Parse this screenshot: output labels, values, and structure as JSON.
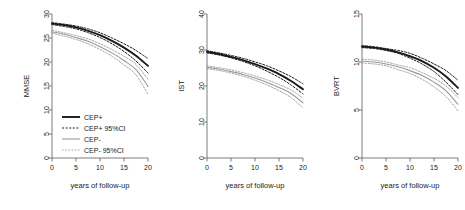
{
  "figure": {
    "title": "",
    "panel_count": 3,
    "background": "#ffffff",
    "colors": {
      "cep_plus": "#1a1a1a",
      "cep_minus": "#9a9a9a",
      "axis": "#5a5a5a",
      "text": "#1a1a1a"
    }
  },
  "legend": {
    "position": "bottom-left of panel 1",
    "items": [
      {
        "label": "CEP+",
        "style": "solid",
        "color": "#1a1a1a",
        "width": 1.9
      },
      {
        "label": "CEP+ 95%CI",
        "style": "dashed",
        "color": "#1a1a1a",
        "width": 1.0
      },
      {
        "label": "CEP-",
        "style": "solid",
        "color": "#9a9a9a",
        "width": 1.1
      },
      {
        "label": "CEP- 95%CI",
        "style": "dashed",
        "color": "#9a9a9a",
        "width": 0.9
      }
    ]
  },
  "chart_data": [
    {
      "type": "line",
      "panel": 1,
      "title": "",
      "xlabel": "years of follow-up",
      "ylabel": "MMSE",
      "xlim": [
        0,
        20
      ],
      "ylim": [
        0,
        30
      ],
      "xticks": [
        0,
        5,
        10,
        15,
        20
      ],
      "yticks": [
        0,
        5,
        10,
        15,
        20,
        25,
        30
      ],
      "grid": false,
      "legend": "inside-bottom-left",
      "x": [
        0,
        2.5,
        5,
        7.5,
        10,
        12.5,
        15,
        17.5,
        20
      ],
      "series": [
        {
          "name": "CEP+",
          "style": "solid",
          "color": "#1a1a1a",
          "values": [
            28.0,
            27.7,
            27.2,
            26.5,
            25.6,
            24.4,
            23.0,
            21.3,
            19.2
          ]
        },
        {
          "name": "CEP+ 95%CI upper",
          "style": "dashed",
          "color": "#1a1a1a",
          "values": [
            28.2,
            27.9,
            27.5,
            26.9,
            26.1,
            25.0,
            23.8,
            22.4,
            20.7
          ]
        },
        {
          "name": "CEP+ 95%CI lower",
          "style": "dashed",
          "color": "#1a1a1a",
          "values": [
            27.8,
            27.4,
            26.9,
            26.1,
            25.1,
            23.8,
            22.2,
            20.2,
            17.7
          ]
        },
        {
          "name": "CEP-",
          "style": "solid",
          "color": "#9a9a9a",
          "values": [
            26.3,
            25.8,
            25.1,
            24.3,
            23.2,
            21.9,
            20.3,
            18.4,
            14.9
          ]
        },
        {
          "name": "CEP- 95%CI upper",
          "style": "dashed",
          "color": "#9a9a9a",
          "values": [
            26.6,
            26.1,
            25.5,
            24.8,
            23.8,
            22.6,
            21.2,
            19.5,
            16.4
          ]
        },
        {
          "name": "CEP- 95%CI lower",
          "style": "dashed",
          "color": "#9a9a9a",
          "values": [
            26.0,
            25.4,
            24.7,
            23.8,
            22.6,
            21.2,
            19.4,
            17.3,
            13.3
          ]
        }
      ]
    },
    {
      "type": "line",
      "panel": 2,
      "title": "",
      "xlabel": "years of follow-up",
      "ylabel": "IST",
      "xlim": [
        0,
        20
      ],
      "ylim": [
        0,
        40
      ],
      "xticks": [
        0,
        5,
        10,
        15,
        20
      ],
      "yticks": [
        0,
        10,
        20,
        30,
        40
      ],
      "grid": false,
      "legend": "none",
      "x": [
        0,
        2.5,
        5,
        7.5,
        10,
        12.5,
        15,
        17.5,
        20
      ],
      "series": [
        {
          "name": "CEP+",
          "style": "solid",
          "color": "#1a1a1a",
          "values": [
            29.5,
            28.9,
            28.1,
            27.2,
            26.1,
            24.8,
            23.3,
            21.4,
            19.1
          ]
        },
        {
          "name": "CEP+ 95%CI upper",
          "style": "dashed",
          "color": "#1a1a1a",
          "values": [
            29.8,
            29.2,
            28.5,
            27.7,
            26.7,
            25.6,
            24.2,
            22.6,
            20.6
          ]
        },
        {
          "name": "CEP+ 95%CI lower",
          "style": "dashed",
          "color": "#1a1a1a",
          "values": [
            29.2,
            28.6,
            27.8,
            26.8,
            25.6,
            24.1,
            22.4,
            20.3,
            17.8
          ]
        },
        {
          "name": "CEP-",
          "style": "solid",
          "color": "#9a9a9a",
          "values": [
            25.2,
            24.7,
            24.0,
            23.2,
            22.2,
            21.0,
            19.6,
            17.9,
            15.3
          ]
        },
        {
          "name": "CEP- 95%CI upper",
          "style": "dashed",
          "color": "#9a9a9a",
          "values": [
            25.6,
            25.1,
            24.5,
            23.7,
            22.8,
            21.7,
            20.4,
            18.9,
            16.6
          ]
        },
        {
          "name": "CEP- 95%CI lower",
          "style": "dashed",
          "color": "#9a9a9a",
          "values": [
            24.8,
            24.3,
            23.6,
            22.7,
            21.6,
            20.3,
            18.7,
            16.8,
            13.9
          ]
        }
      ]
    },
    {
      "type": "line",
      "panel": 3,
      "title": "",
      "xlabel": "years of follow-up",
      "ylabel": "BVRT",
      "xlim": [
        0,
        20
      ],
      "ylim": [
        0,
        15
      ],
      "xticks": [
        0,
        5,
        10,
        15,
        20
      ],
      "yticks": [
        0,
        5,
        10,
        15
      ],
      "grid": false,
      "legend": "none",
      "x": [
        0,
        2.5,
        5,
        7.5,
        10,
        12.5,
        15,
        17.5,
        20
      ],
      "series": [
        {
          "name": "CEP+",
          "style": "solid",
          "color": "#1a1a1a",
          "values": [
            11.6,
            11.5,
            11.3,
            11.0,
            10.6,
            10.1,
            9.4,
            8.5,
            7.3
          ]
        },
        {
          "name": "CEP+ 95%CI upper",
          "style": "dashed",
          "color": "#1a1a1a",
          "values": [
            11.7,
            11.6,
            11.4,
            11.2,
            10.9,
            10.4,
            9.8,
            9.1,
            8.1
          ]
        },
        {
          "name": "CEP+ 95%CI lower",
          "style": "dashed",
          "color": "#1a1a1a",
          "values": [
            11.5,
            11.4,
            11.2,
            10.9,
            10.4,
            9.8,
            9.0,
            7.9,
            6.6
          ]
        },
        {
          "name": "CEP-",
          "style": "solid",
          "color": "#9a9a9a",
          "values": [
            10.1,
            10.0,
            9.8,
            9.5,
            9.1,
            8.6,
            7.9,
            7.0,
            5.6
          ]
        },
        {
          "name": "CEP- 95%CI upper",
          "style": "dashed",
          "color": "#9a9a9a",
          "values": [
            10.3,
            10.2,
            10.0,
            9.7,
            9.4,
            8.9,
            8.3,
            7.5,
            6.3
          ]
        },
        {
          "name": "CEP- 95%CI lower",
          "style": "dashed",
          "color": "#9a9a9a",
          "values": [
            9.9,
            9.8,
            9.6,
            9.2,
            8.8,
            8.2,
            7.4,
            6.4,
            4.9
          ]
        }
      ]
    }
  ]
}
